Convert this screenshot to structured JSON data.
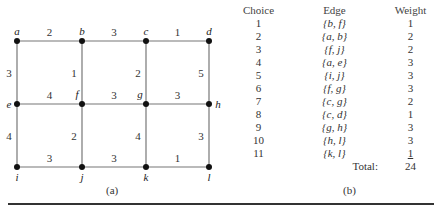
{
  "figure": {
    "graph": {
      "caption": "(a)",
      "nodes": [
        {
          "id": "a",
          "x": 17,
          "y": 41
        },
        {
          "id": "b",
          "x": 82,
          "y": 41
        },
        {
          "id": "c",
          "x": 146,
          "y": 41
        },
        {
          "id": "d",
          "x": 209,
          "y": 41
        },
        {
          "id": "e",
          "x": 17,
          "y": 104
        },
        {
          "id": "f",
          "x": 82,
          "y": 104
        },
        {
          "id": "g",
          "x": 146,
          "y": 104
        },
        {
          "id": "h",
          "x": 209,
          "y": 104
        },
        {
          "id": "i",
          "x": 17,
          "y": 167
        },
        {
          "id": "j",
          "x": 82,
          "y": 167
        },
        {
          "id": "k",
          "x": 146,
          "y": 167
        },
        {
          "id": "l",
          "x": 209,
          "y": 167
        }
      ],
      "edges": [
        {
          "u": "a",
          "v": "b",
          "w": "2"
        },
        {
          "u": "b",
          "v": "c",
          "w": "3"
        },
        {
          "u": "c",
          "v": "d",
          "w": "1"
        },
        {
          "u": "a",
          "v": "e",
          "w": "3"
        },
        {
          "u": "b",
          "v": "f",
          "w": "1"
        },
        {
          "u": "c",
          "v": "g",
          "w": "2"
        },
        {
          "u": "d",
          "v": "h",
          "w": "5"
        },
        {
          "u": "e",
          "v": "f",
          "w": "4"
        },
        {
          "u": "f",
          "v": "g",
          "w": "3"
        },
        {
          "u": "g",
          "v": "h",
          "w": "3"
        },
        {
          "u": "e",
          "v": "i",
          "w": "4"
        },
        {
          "u": "f",
          "v": "j",
          "w": "2"
        },
        {
          "u": "g",
          "v": "k",
          "w": "4"
        },
        {
          "u": "h",
          "v": "l",
          "w": "3"
        },
        {
          "u": "i",
          "v": "j",
          "w": "3"
        },
        {
          "u": "j",
          "v": "k",
          "w": "3"
        },
        {
          "u": "k",
          "v": "l",
          "w": "1"
        }
      ]
    },
    "table": {
      "caption": "(b)",
      "headers": {
        "choice": "Choice",
        "edge": "Edge",
        "weight": "Weight"
      },
      "rows": [
        {
          "choice": "1",
          "edge": "{b, f}",
          "weight": "1"
        },
        {
          "choice": "2",
          "edge": "{a, b}",
          "weight": "2"
        },
        {
          "choice": "3",
          "edge": "{f, j}",
          "weight": "2"
        },
        {
          "choice": "4",
          "edge": "{a, e}",
          "weight": "3"
        },
        {
          "choice": "5",
          "edge": "{i, j}",
          "weight": "3"
        },
        {
          "choice": "6",
          "edge": "{f, g}",
          "weight": "3"
        },
        {
          "choice": "7",
          "edge": "{c, g}",
          "weight": "2"
        },
        {
          "choice": "8",
          "edge": "{c, d}",
          "weight": "1"
        },
        {
          "choice": "9",
          "edge": "{g, h}",
          "weight": "3"
        },
        {
          "choice": "10",
          "edge": "{h, l}",
          "weight": "3"
        },
        {
          "choice": "11",
          "edge": "{k, l}",
          "weight": "1"
        }
      ],
      "total_label": "Total:",
      "total_value": "24"
    }
  }
}
